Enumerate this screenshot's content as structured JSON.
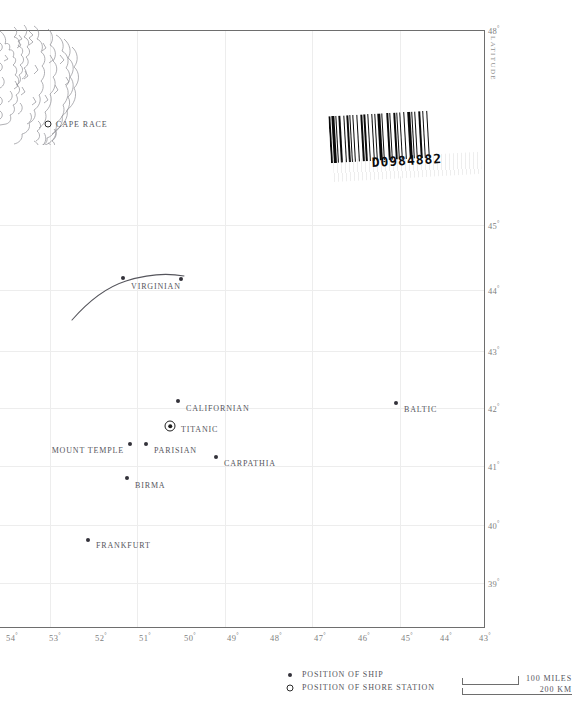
{
  "map": {
    "title": "North Atlantic — Positions of Ships at the Time of the Titanic Disaster",
    "axis_lat_title": "LATITUDE",
    "lat_ticks": [
      {
        "label": "48",
        "deg": "°",
        "y": 30
      },
      {
        "label": "45",
        "deg": "°",
        "y": 225
      },
      {
        "label": "44",
        "deg": "°",
        "y": 290
      },
      {
        "label": "43",
        "deg": "°",
        "y": 351
      },
      {
        "label": "42",
        "deg": "°",
        "y": 408
      },
      {
        "label": "41",
        "deg": "°",
        "y": 466
      },
      {
        "label": "40",
        "deg": "°",
        "y": 525
      },
      {
        "label": "39",
        "deg": "°",
        "y": 583
      }
    ],
    "lon_ticks": [
      {
        "label": "54",
        "deg": "°",
        "x": 12
      },
      {
        "label": "53",
        "deg": "°",
        "x": 55
      },
      {
        "label": "52",
        "deg": "°",
        "x": 101
      },
      {
        "label": "51",
        "deg": "°",
        "x": 145
      },
      {
        "label": "50",
        "deg": "°",
        "x": 190
      },
      {
        "label": "49",
        "deg": "°",
        "x": 233
      },
      {
        "label": "48",
        "deg": "°",
        "x": 276
      },
      {
        "label": "47",
        "deg": "°",
        "x": 320
      },
      {
        "label": "46",
        "deg": "°",
        "x": 364
      },
      {
        "label": "45",
        "deg": "°",
        "x": 407
      },
      {
        "label": "44",
        "deg": "°",
        "x": 446
      },
      {
        "label": "43",
        "deg": "°",
        "x": 485
      }
    ],
    "gridlines_v": [
      50,
      137,
      225,
      312,
      400
    ],
    "gridlines_h": [
      225,
      290,
      351,
      408,
      466,
      525,
      583
    ]
  },
  "places": [
    {
      "name": "CAPE RACE",
      "type": "shore",
      "x": 48,
      "y": 124,
      "label_x": 56,
      "label_y": 124,
      "align": "right"
    },
    {
      "name": "VIRGINIAN",
      "type": "ship",
      "x": 181,
      "y": 279,
      "label_x": 131,
      "label_y": 286,
      "align": "right"
    },
    {
      "name": "CALIFORNIAN",
      "type": "ship",
      "x": 178,
      "y": 401,
      "label_x": 186,
      "label_y": 408,
      "align": "right"
    },
    {
      "name": "TITANIC",
      "type": "titanic",
      "x": 170,
      "y": 426,
      "label_x": 181,
      "label_y": 429,
      "align": "right"
    },
    {
      "name": "BALTIC",
      "type": "ship",
      "x": 396,
      "y": 403,
      "label_x": 404,
      "label_y": 409,
      "align": "right"
    },
    {
      "name": "MOUNT TEMPLE",
      "type": "ship",
      "x": 130,
      "y": 444,
      "label_x": 124,
      "label_y": 450,
      "align": "left"
    },
    {
      "name": "PARISIAN",
      "type": "ship",
      "x": 146,
      "y": 444,
      "label_x": 154,
      "label_y": 450,
      "align": "right"
    },
    {
      "name": "CARPATHIA",
      "type": "ship",
      "x": 216,
      "y": 457,
      "label_x": 224,
      "label_y": 463,
      "align": "right"
    },
    {
      "name": "BIRMA",
      "type": "ship",
      "x": 127,
      "y": 478,
      "label_x": 135,
      "label_y": 485,
      "align": "right"
    },
    {
      "name": "FRANKFURT",
      "type": "ship",
      "x": 88,
      "y": 540,
      "label_x": 96,
      "label_y": 545,
      "align": "right"
    }
  ],
  "track": {
    "name": "virginian-track",
    "waypoint_x": 123,
    "waypoint_y": 278
  },
  "barcode": {
    "number": "D0984882",
    "pattern": "2131121312211213131122131212311321132112131231121322131"
  },
  "legend": {
    "items": [
      {
        "symbol": "ship",
        "label": "POSITION OF SHIP"
      },
      {
        "symbol": "shore",
        "label": "POSITION OF SHORE STATION"
      }
    ]
  },
  "scale": {
    "miles_label": "100 MILES",
    "km_label": "200 KM"
  }
}
